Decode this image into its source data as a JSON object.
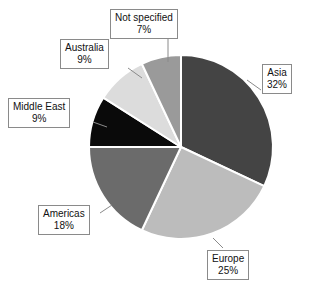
{
  "chart_data": {
    "type": "pie",
    "title": "",
    "subtitle": "",
    "xlabel": "",
    "ylabel": "",
    "legend_position": "callout-labels",
    "grid": false,
    "start_angle_deg": 0,
    "direction": "clockwise",
    "categories": [
      "Asia",
      "Europe",
      "Americas",
      "Middle East",
      "Australia",
      "Not specified"
    ],
    "values": [
      32,
      25,
      18,
      9,
      9,
      7
    ],
    "unit": "%",
    "slices": [
      {
        "label": "Asia",
        "value": 32,
        "value_text": "32%",
        "color": "#444444"
      },
      {
        "label": "Europe",
        "value": 25,
        "value_text": "25%",
        "color": "#bcbcbc"
      },
      {
        "label": "Americas",
        "value": 18,
        "value_text": "18%",
        "color": "#6b6b6b"
      },
      {
        "label": "Middle East",
        "value": 9,
        "value_text": "9%",
        "color": "#0a0a0a"
      },
      {
        "label": "Australia",
        "value": 9,
        "value_text": "9%",
        "color": "#dcdcdc"
      },
      {
        "label": "Not specified",
        "value": 7,
        "value_text": "7%",
        "color": "#9a9a9a"
      }
    ]
  },
  "callouts": {
    "not_specified": {
      "category": "Not specified",
      "percent": "7%"
    },
    "australia": {
      "category": "Australia",
      "percent": "9%"
    },
    "middle_east": {
      "category": "Middle East",
      "percent": "9%"
    },
    "americas": {
      "category": "Americas",
      "percent": "18%"
    },
    "europe": {
      "category": "Europe",
      "percent": "25%"
    },
    "asia": {
      "category": "Asia",
      "percent": "32%"
    }
  },
  "colors": {
    "asia": "#444444",
    "europe": "#bcbcbc",
    "americas": "#6b6b6b",
    "middle_east": "#0a0a0a",
    "australia": "#dcdcdc",
    "not_specified": "#9a9a9a",
    "slice_border": "#ffffff",
    "callout_border": "#8a8a8a",
    "callout_background": "#ffffff",
    "text": "#111111"
  }
}
